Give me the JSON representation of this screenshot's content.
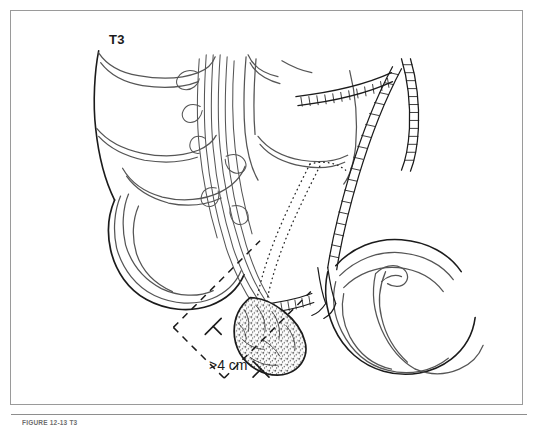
{
  "figure": {
    "stage_label": "T3",
    "measurement_label": ">4 cm",
    "caption": "FIGURE 12-13   T3",
    "frame_color": "#9a9a9a",
    "ink_color": "#1b1b1b",
    "line_color": "#555555",
    "background": "#ffffff"
  },
  "illustration": {
    "type": "medical-line-art",
    "subject": "gallbladder carcinoma staging diagram",
    "elements": [
      {
        "name": "liver-lobe-upper-left",
        "style": "outline"
      },
      {
        "name": "liver-lobe-upper-right",
        "style": "outline"
      },
      {
        "name": "gallbladder-body",
        "style": "outline"
      },
      {
        "name": "hepatic-vessels",
        "style": "multi-stroke-bundle"
      },
      {
        "name": "bile-duct-ladder-right",
        "style": "segmented-ladder"
      },
      {
        "name": "bile-duct-ladder-upper",
        "style": "segmented-ladder"
      },
      {
        "name": "cystic-duct-ladder",
        "style": "segmented-ladder"
      },
      {
        "name": "tumor-mass",
        "style": "stippled-mottled"
      },
      {
        "name": "resection-plane-dotted",
        "style": "dotted"
      },
      {
        "name": "duodenum",
        "style": "outline"
      },
      {
        "name": "pancreas-head",
        "style": "outline"
      },
      {
        "name": "measurement-caliper",
        "style": "dashed-with-brackets"
      }
    ]
  }
}
